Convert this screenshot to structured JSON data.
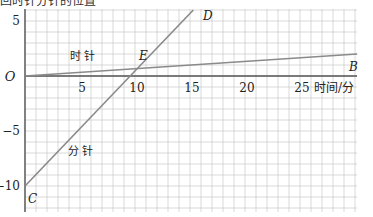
{
  "header": {
    "cut_title": "回时针分针的位置"
  },
  "chart_data": {
    "type": "line",
    "title": "",
    "xlabel": "时间/分",
    "ylabel": "",
    "xlim": [
      0,
      30.2
    ],
    "ylim": [
      -12,
      6.9
    ],
    "grid": true,
    "x_ticks": [
      5,
      10,
      15,
      20,
      25
    ],
    "y_ticks": [
      5,
      -5,
      -10
    ],
    "origin_label": "O",
    "series": [
      {
        "name": "时针",
        "label": "时 针",
        "points": [
          [
            0,
            0
          ],
          [
            30.2,
            2.0
          ]
        ],
        "end_label": "B"
      },
      {
        "name": "分针",
        "label": "分 针",
        "points": [
          [
            0,
            -10
          ],
          [
            15.3,
            6.0
          ]
        ],
        "start_label": "C",
        "end_label": "D"
      }
    ],
    "annotations": [
      {
        "text": "E",
        "x": 10.9,
        "y": 0.9,
        "note": "intersection of hour and minute hand lines"
      }
    ]
  },
  "colors": {
    "grid": "#c8c8c8",
    "axis": "#555555",
    "line": "#8a8a8a",
    "text": "#222222"
  }
}
